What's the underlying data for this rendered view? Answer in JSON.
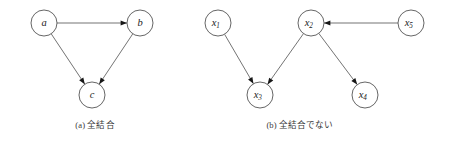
{
  "figure": {
    "background_color": "#ffffff",
    "stroke_color": "#5a5a5a",
    "node_stroke_color": "#4a4a4a",
    "node_fill_color": "#ffffff",
    "arrow_color": "#171717",
    "label_color": "#232323",
    "caption_color": "#3a3a3a",
    "node_radius": 13
  },
  "panels": [
    {
      "id": "panel-a",
      "caption": "(a) 全結合",
      "caption_tag": "(a)",
      "caption_body": "全結合",
      "caption_x": 95,
      "caption_y": 118,
      "nodes": [
        {
          "id": "a",
          "label": "a",
          "sub": "",
          "cx": 44,
          "cy": 23
        },
        {
          "id": "b",
          "label": "b",
          "sub": "",
          "cx": 140,
          "cy": 23
        },
        {
          "id": "c",
          "label": "c",
          "sub": "",
          "cx": 92,
          "cy": 95
        }
      ],
      "edges": [
        {
          "from": "a",
          "to": "b"
        },
        {
          "from": "a",
          "to": "c"
        },
        {
          "from": "b",
          "to": "c"
        }
      ]
    },
    {
      "id": "panel-b",
      "caption": "(b) 全結合でない",
      "caption_tag": "(b)",
      "caption_body": "全結合でない",
      "caption_x": 300,
      "caption_y": 118,
      "nodes": [
        {
          "id": "x1",
          "label": "x",
          "sub": "1",
          "cx": 218,
          "cy": 23
        },
        {
          "id": "x2",
          "label": "x",
          "sub": "2",
          "cx": 311,
          "cy": 23
        },
        {
          "id": "x5",
          "label": "x",
          "sub": "5",
          "cx": 411,
          "cy": 23
        },
        {
          "id": "x3",
          "label": "x",
          "sub": "3",
          "cx": 260,
          "cy": 95
        },
        {
          "id": "x4",
          "label": "x",
          "sub": "4",
          "cx": 365,
          "cy": 95
        }
      ],
      "edges": [
        {
          "from": "x1",
          "to": "x3"
        },
        {
          "from": "x2",
          "to": "x3"
        },
        {
          "from": "x2",
          "to": "x4"
        },
        {
          "from": "x5",
          "to": "x2"
        }
      ]
    }
  ]
}
